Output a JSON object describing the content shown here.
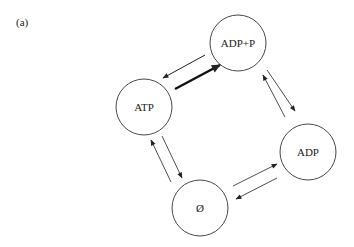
{
  "panel_label": "(a)",
  "nodes": {
    "adp_p": {
      "label": "ADP+P",
      "cx": 238,
      "cy": 43,
      "r": 28
    },
    "atp": {
      "label": "ATP",
      "cx": 144,
      "cy": 107,
      "r": 28
    },
    "adp": {
      "label": "ADP",
      "cx": 308,
      "cy": 152,
      "r": 28
    },
    "empty": {
      "label": "Ø",
      "cx": 200,
      "cy": 208,
      "r": 28
    }
  },
  "edges": [
    {
      "from": "ADP+P",
      "to": "ATP",
      "weight": "thin"
    },
    {
      "from": "ATP",
      "to": "ADP+P",
      "weight": "thick"
    },
    {
      "from": "ADP",
      "to": "ADP+P",
      "weight": "thin"
    },
    {
      "from": "ADP+P",
      "to": "ADP",
      "weight": "thin"
    },
    {
      "from": "ATP",
      "to": "Ø",
      "weight": "thin"
    },
    {
      "from": "Ø",
      "to": "ATP",
      "weight": "thin"
    },
    {
      "from": "Ø",
      "to": "ADP",
      "weight": "thin"
    },
    {
      "from": "ADP",
      "to": "Ø",
      "weight": "thin"
    }
  ],
  "colors": {
    "stroke": "#222222",
    "background": "#ffffff"
  }
}
